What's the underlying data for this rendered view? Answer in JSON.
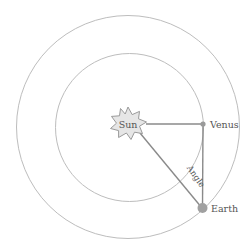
{
  "diagram": {
    "colors": {
      "orbit": "#bdbdbd",
      "line": "#8a8a8a",
      "sun_fill": "#e6e6e6",
      "sun_stroke": "#9a9a9a",
      "planet": "#9a9a9a",
      "text": "#555555"
    },
    "labels": {
      "sun": "Sun",
      "venus": "Venus",
      "earth": "Earth",
      "angle": "Angle"
    },
    "orbits": [
      {
        "name": "Venus orbit",
        "cx": 129,
        "cy": 127,
        "r": 74
      },
      {
        "name": "Earth orbit",
        "cx": 128,
        "cy": 127,
        "r": 112
      }
    ]
  }
}
